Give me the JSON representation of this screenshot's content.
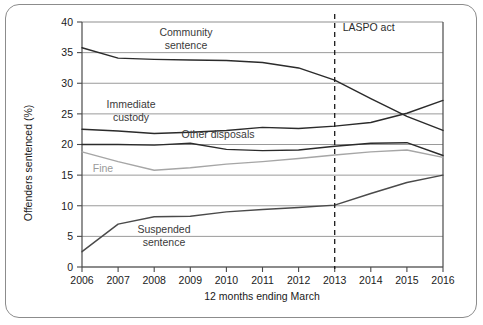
{
  "chart_data": {
    "type": "line",
    "title": "",
    "xlabel": "12 months ending March",
    "ylabel": "Offenders sentenced (%)",
    "categories": [
      "2006",
      "2007",
      "2008",
      "2009",
      "2010",
      "2011",
      "2012",
      "2013",
      "2014",
      "2015",
      "2016"
    ],
    "x": [
      2006,
      2007,
      2008,
      2009,
      2010,
      2011,
      2012,
      2013,
      2014,
      2015,
      2016
    ],
    "ylim": [
      0,
      40
    ],
    "yticks": [
      0,
      5,
      10,
      15,
      20,
      25,
      30,
      35,
      40
    ],
    "grid": true,
    "legend": "inline-labels",
    "series": [
      {
        "name": "Community sentence",
        "color": "#2b2b2b",
        "values": [
          35.8,
          34.1,
          33.9,
          33.8,
          33.7,
          33.4,
          32.5,
          30.5,
          27.5,
          24.6,
          22.3
        ]
      },
      {
        "name": "Immediate custody",
        "color": "#2b2b2b",
        "values": [
          22.5,
          22.2,
          21.8,
          22.0,
          22.3,
          22.8,
          22.6,
          23.0,
          23.6,
          25.1,
          27.2
        ]
      },
      {
        "name": "Other disposals",
        "color": "#2b2b2b",
        "values": [
          20.0,
          20.0,
          19.9,
          20.2,
          19.2,
          19.0,
          19.1,
          19.7,
          20.2,
          20.3,
          18.2
        ]
      },
      {
        "name": "Fine",
        "color": "#a6a6a6",
        "values": [
          18.8,
          17.2,
          15.8,
          16.2,
          16.8,
          17.2,
          17.7,
          18.3,
          18.8,
          19.1,
          17.9
        ]
      },
      {
        "name": "Suspended sentence",
        "color": "#4a4a4a",
        "values": [
          2.5,
          7.0,
          8.2,
          8.3,
          9.0,
          9.4,
          9.7,
          10.1,
          12.0,
          13.8,
          15.0
        ]
      }
    ],
    "annotations": [
      {
        "name": "laspo-act",
        "label": "LASPO act",
        "x": 2013,
        "style": "dashed-vertical-line",
        "color": "#1a1a1a"
      }
    ],
    "inline_labels": [
      {
        "name": "community-sentence",
        "line1": "Community",
        "line2": "sentence",
        "tone": "dark"
      },
      {
        "name": "immediate-custody",
        "line1": "Immediate",
        "line2": "custody",
        "tone": "dark"
      },
      {
        "name": "other-disposals",
        "line1": "Other disposals",
        "line2": "",
        "tone": "dark"
      },
      {
        "name": "fine",
        "line1": "Fine",
        "line2": "",
        "tone": "light"
      },
      {
        "name": "suspended-sentence",
        "line1": "Suspended",
        "line2": "sentence",
        "tone": "dark"
      }
    ]
  }
}
